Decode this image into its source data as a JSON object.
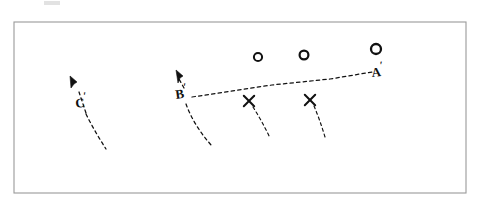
{
  "figure": {
    "background_color": "#ffffff",
    "ink_color": "#111111",
    "frame": {
      "name": "figure-frame",
      "x": 14,
      "y": 22,
      "width": 452,
      "height": 171,
      "stroke_color": "#9a9a9a",
      "stroke_width": 1.1,
      "fill": "none"
    },
    "smudge": {
      "name": "scan-artifact",
      "x": 44,
      "y": 1,
      "width": 16,
      "height": 4,
      "color": "#e2e2e2"
    }
  },
  "labels": [
    {
      "id": "label-c-prime",
      "text": "C",
      "prime": "′",
      "x": 76,
      "y": 108,
      "font_size": 13,
      "prime_dx": 9,
      "prime_dy": -7,
      "prime_font_size": 11,
      "rotation": -8
    },
    {
      "id": "label-b-prime",
      "text": "B",
      "prime": "′",
      "x": 176,
      "y": 99,
      "font_size": 13,
      "prime_dx": 9,
      "prime_dy": -7,
      "prime_font_size": 11,
      "rotation": -8
    },
    {
      "id": "label-a-prime",
      "text": "A",
      "prime": "′",
      "x": 372,
      "y": 77,
      "font_size": 13,
      "prime_dx": 9,
      "prime_dy": -7,
      "prime_font_size": 11,
      "rotation": -6
    }
  ],
  "vectors": [
    {
      "id": "vector-c-prime",
      "label_ref": "C",
      "arrow_tip_x": 70,
      "arrow_tip_y": 76,
      "arrow_head_path": "M 70 76 L 77 82 L 74 84 L 71 88 Z",
      "shaft_path": "M 86 113 L 79 92",
      "tail_path": "M 86 114 Q 95 132 106 149",
      "dash_pattern": "3.2 3.2",
      "stroke_width": 1.25
    },
    {
      "id": "vector-b-prime",
      "label_ref": "B",
      "arrow_tip_x": 176,
      "arrow_tip_y": 70,
      "arrow_head_path": "M 176 70 L 183 76 L 180 78 L 178 83 Z",
      "shaft_path": "M 184 88 L 179 79",
      "tail_path": "M 186 104 Q 194 126 212 146",
      "dash_pattern": "3.2 3.2",
      "stroke_width": 1.25
    }
  ],
  "baseline": {
    "id": "baseline-b-to-a",
    "description": "long dashed line from B-prime up to A-prime",
    "path": "M 192 97 L 272 85 L 330 79 L 372 72",
    "dash_pattern": "3.4 3.2",
    "stroke_width": 1.25
  },
  "circles": [
    {
      "id": "circle-1",
      "cx": 258,
      "cy": 57,
      "r": 4.1,
      "stroke_width": 2.0
    },
    {
      "id": "circle-2",
      "cx": 304,
      "cy": 55,
      "r": 4.4,
      "stroke_width": 2.2
    },
    {
      "id": "circle-3",
      "cx": 376,
      "cy": 49,
      "r": 5.0,
      "stroke_width": 2.3
    }
  ],
  "crosses": [
    {
      "id": "cross-1",
      "cx": 249,
      "cy": 101,
      "size": 5.2,
      "stroke_width": 2.0,
      "tail_path": "M 253 107 Q 262 121 270 138",
      "tail_dash": "3.0 3.0"
    },
    {
      "id": "cross-2",
      "cx": 310,
      "cy": 100,
      "size": 5.2,
      "stroke_width": 2.0,
      "tail_path": "M 314 106 Q 320 120 325 137",
      "tail_dash": "3.0 3.0"
    }
  ]
}
